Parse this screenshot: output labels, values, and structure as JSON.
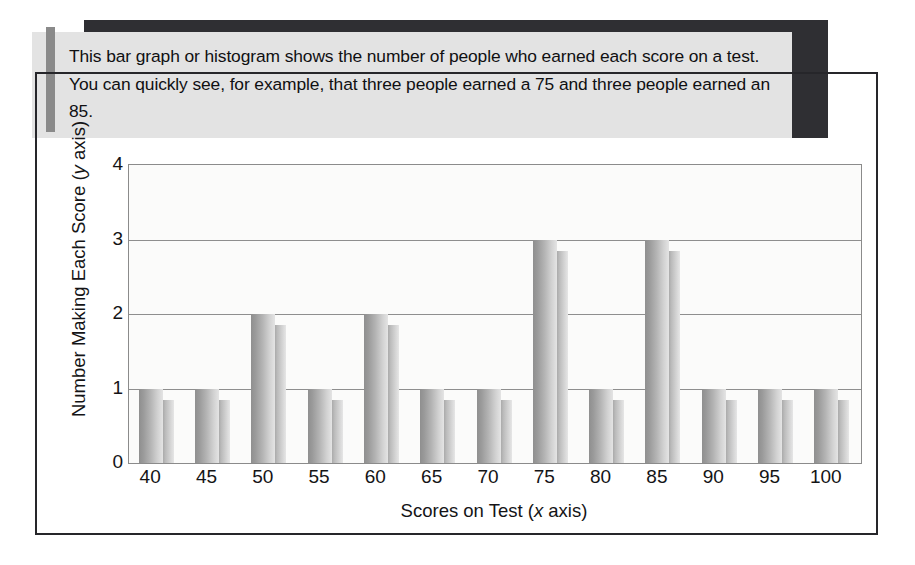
{
  "callout": {
    "text": "This bar graph or histogram shows the number of people who earned each score on a test. You can quickly see, for example, that three people earned a 75 and three people earned an 85.",
    "accent_color": "#8a8a8a",
    "background_color": "#e3e3e3",
    "shadow_color": "#2f2f33"
  },
  "chart_data": {
    "type": "bar",
    "title": "",
    "xlabel": "Scores on Test (x axis)",
    "ylabel": "Number Making Each Score (y axis)",
    "xlabel_parts": {
      "before": "Scores on Test (",
      "italic": "x",
      "after": " axis)"
    },
    "ylabel_parts": {
      "before": "Number Making Each Score (",
      "italic": "y",
      "after": " axis)"
    },
    "categories": [
      "40",
      "45",
      "50",
      "55",
      "60",
      "65",
      "70",
      "75",
      "80",
      "85",
      "90",
      "95",
      "100"
    ],
    "values": [
      1,
      1,
      2,
      1,
      2,
      1,
      1,
      3,
      1,
      3,
      1,
      1,
      1
    ],
    "ylim": [
      0,
      4
    ],
    "yticks": [
      "0",
      "1",
      "2",
      "3",
      "4"
    ],
    "ytick_values": [
      0,
      1,
      2,
      3,
      4
    ],
    "grid": true,
    "legend": "none",
    "bar_color": "#b4b4b4",
    "bar_style": "3d-gradient",
    "plot_background": "#fbfbfa",
    "gridline_color": "#8e8e8e",
    "frame_color": "#26262a"
  }
}
